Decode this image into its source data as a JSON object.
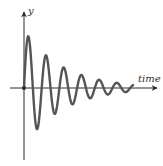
{
  "diagram": {
    "y_axis_label": "y",
    "x_axis_label": "time",
    "colors": {
      "axis": "#2a2a2a",
      "curve": "#555555",
      "label": "#333333",
      "background": "#ffffff"
    },
    "origin": {
      "x": 24,
      "y": 88
    },
    "wave": {
      "start_x": 24,
      "end_x": 133,
      "initial_amplitude": 58,
      "decay_per_px": 0.026,
      "period_px": 17.7,
      "stroke_width": 2.4
    }
  },
  "chart_data": {
    "type": "line",
    "title": "",
    "xlabel": "time",
    "ylabel": "y",
    "grid": false,
    "peaks_approx": [
      {
        "x": 29,
        "y": 33
      },
      {
        "x": 47,
        "y": 43
      },
      {
        "x": 65,
        "y": 52
      },
      {
        "x": 83,
        "y": 61
      },
      {
        "x": 100,
        "y": 71
      },
      {
        "x": 117,
        "y": 80
      }
    ],
    "troughs_approx": [
      {
        "x": 38,
        "y": 138
      },
      {
        "x": 55,
        "y": 129
      },
      {
        "x": 73,
        "y": 119
      },
      {
        "x": 91,
        "y": 110
      },
      {
        "x": 108,
        "y": 101
      },
      {
        "x": 125,
        "y": 94
      }
    ]
  }
}
